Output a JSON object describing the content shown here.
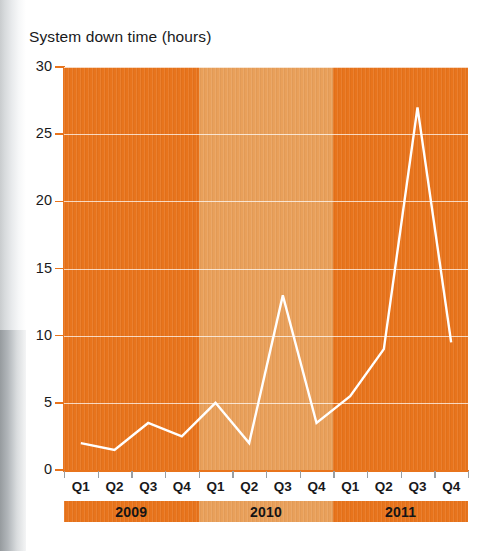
{
  "chart_data": {
    "type": "line",
    "title": "System down time (hours)",
    "xlabel": "",
    "ylabel": "",
    "ylim": [
      0,
      30
    ],
    "yticks": [
      0,
      5,
      10,
      15,
      20,
      25,
      30
    ],
    "grid": true,
    "legend": "none",
    "categories": [
      "Q1",
      "Q2",
      "Q3",
      "Q4",
      "Q1",
      "Q2",
      "Q3",
      "Q4",
      "Q1",
      "Q2",
      "Q3",
      "Q4"
    ],
    "group_labels": [
      "2009",
      "2010",
      "2011"
    ],
    "series": [
      {
        "name": "System down time",
        "values": [
          2,
          1.5,
          3.5,
          2.5,
          5,
          2,
          13,
          3.5,
          5.5,
          9,
          27,
          9.5
        ]
      }
    ],
    "groups": [
      {
        "label": "2009",
        "quarters": [
          "Q1",
          "Q2",
          "Q3",
          "Q4"
        ],
        "values": [
          2,
          1.5,
          3.5,
          2.5
        ]
      },
      {
        "label": "2010",
        "quarters": [
          "Q1",
          "Q2",
          "Q3",
          "Q4"
        ],
        "values": [
          5,
          2,
          13,
          3.5
        ]
      },
      {
        "label": "2011",
        "quarters": [
          "Q1",
          "Q2",
          "Q3",
          "Q4"
        ],
        "values": [
          5.5,
          9,
          27,
          9.5
        ]
      }
    ]
  },
  "axis": {
    "y_labels": [
      "30",
      "25",
      "20",
      "15",
      "10",
      "5",
      "0"
    ],
    "x_labels": [
      "Q1",
      "Q2",
      "Q3",
      "Q4",
      "Q1",
      "Q2",
      "Q3",
      "Q4",
      "Q1",
      "Q2",
      "Q3",
      "Q4"
    ]
  },
  "year_bar": {
    "segments": [
      {
        "label": "2009",
        "color": "#e8741c"
      },
      {
        "label": "2010",
        "color": "#e9a05a"
      },
      {
        "label": "2011",
        "color": "#e8741c"
      }
    ]
  },
  "colors": {
    "band_dark": "#e8741c",
    "band_light": "#e9a05a",
    "line": "#ffffff",
    "gridline": "#ffffff",
    "axis": "#e8741c",
    "text": "#19191b",
    "page_background": "#ffffff"
  }
}
